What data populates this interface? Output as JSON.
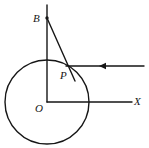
{
  "figure": {
    "background_color": "#ffffff",
    "stroke_color": "#161616",
    "width": 149,
    "height": 148,
    "labels": {
      "point_b": "B",
      "point_p": "P",
      "origin": "O",
      "axis_x": "X"
    },
    "elements": {
      "circle_name": "circle centered at O",
      "vertical_axis_name": "vertical line through O and B",
      "horizontal_axis_name": "horizontal axis OX",
      "tangent_segment_name": "segment from B through P",
      "ray_name": "horizontal ray through P with direction arrow"
    },
    "geometry": {
      "circle": {
        "cx": 47,
        "cy": 102,
        "r": 42
      },
      "origin": {
        "x": 47,
        "y": 102
      },
      "point_b": {
        "x": 47,
        "y": 18
      },
      "point_p": {
        "x": 68,
        "y": 67
      },
      "vertical_line": {
        "x": 47,
        "y_top": 5,
        "y_bottom": 102
      },
      "horizontal_axis": {
        "x_start": 47,
        "x_end": 132,
        "y": 102
      },
      "tangent_segment": {
        "x1": 47,
        "y1": 18,
        "x2": 75,
        "y2": 81
      },
      "horizontal_ray": {
        "x_start": 66,
        "x_end": 144,
        "y": 66
      },
      "arrow_marker": {
        "x": 101,
        "y": 66,
        "direction": "left"
      }
    }
  }
}
